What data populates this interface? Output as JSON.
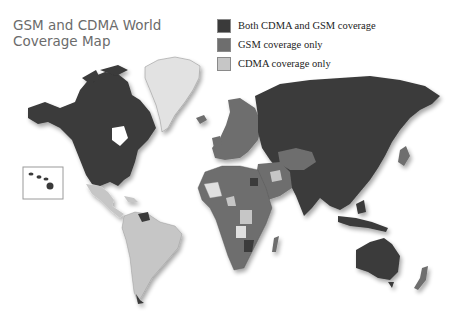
{
  "title": {
    "line1": "GSM and CDMA World",
    "line2": "Coverage Map"
  },
  "legend": {
    "items": [
      {
        "label": "Both CDMA and GSM coverage",
        "color": "#3a3a3a"
      },
      {
        "label": "GSM coverage only",
        "color": "#6e6e6e"
      },
      {
        "label": "CDMA coverage only",
        "color": "#c6c6c6"
      }
    ]
  },
  "map": {
    "inset": "hawaii-inset",
    "colors": {
      "both": "#3a3a3a",
      "gsm": "#6e6e6e",
      "cdma": "#c6c6c6",
      "greenland": "#e4e4e4",
      "background": "#ffffff"
    }
  }
}
